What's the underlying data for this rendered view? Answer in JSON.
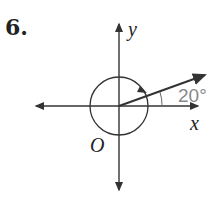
{
  "problem": {
    "number": "6."
  },
  "diagram": {
    "y_label": "y",
    "x_label": "x",
    "origin_label": "O",
    "angle_label": "20°",
    "angle_color": "#888888"
  }
}
